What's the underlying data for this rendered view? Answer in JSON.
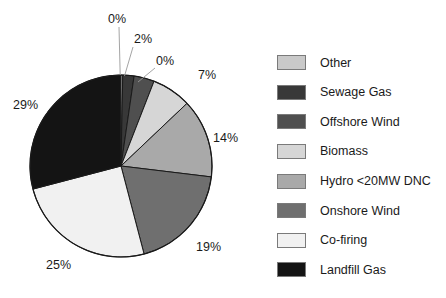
{
  "chart_data": {
    "type": "pie",
    "title": "",
    "subtitle": "",
    "xlabel": "",
    "ylabel": "",
    "legend_position": "right",
    "grid": false,
    "categories": [
      "Other",
      "Sewage Gas",
      "Offshore Wind",
      "Biomass",
      "Hydro <20MW DNC",
      "Onshore Wind",
      "Co-firing",
      "Landfill Gas"
    ],
    "values": [
      0,
      2,
      0,
      7,
      14,
      19,
      25,
      29
    ],
    "data_labels": [
      "0%",
      "2%",
      "0%",
      "7%",
      "14%",
      "19%",
      "25%",
      "29%"
    ],
    "slice_colors": [
      "#c9c9c9",
      "#383838",
      "#4f4f4f",
      "#d6d6d6",
      "#a9a9a9",
      "#6f6f6f",
      "#f1f1f1",
      "#141414"
    ],
    "slice_render_sweeps_deg": [
      1.1,
      7.2,
      13.0,
      25.2,
      50.4,
      68.4,
      90.0,
      104.4
    ],
    "start_angle_deg": 0,
    "direction": "clockwise",
    "stroke_color": "#1a1a1a"
  },
  "pie": {
    "center_x": 121,
    "center_y": 166,
    "radius": 91,
    "labels": [
      {
        "text": "0%",
        "x": 108,
        "y": 12,
        "leader": {
          "x1": 119,
          "y1": 27,
          "x2": 120.2,
          "y2": 75
        }
      },
      {
        "text": "2%",
        "x": 134,
        "y": 32,
        "leader": {
          "x1": 133,
          "y1": 47,
          "x2": 124.5,
          "y2": 76
        }
      },
      {
        "text": "0%",
        "x": 156,
        "y": 54,
        "leader": {
          "x1": 155,
          "y1": 68,
          "x2": 138,
          "y2": 82
        }
      },
      {
        "text": "7%",
        "x": 198,
        "y": 68,
        "leader": null
      },
      {
        "text": "14%",
        "x": 213,
        "y": 131,
        "leader": null
      },
      {
        "text": "19%",
        "x": 196,
        "y": 240,
        "leader": null
      },
      {
        "text": "25%",
        "x": 46,
        "y": 258,
        "leader": null
      },
      {
        "text": "29%",
        "x": 13,
        "y": 98,
        "leader": null
      }
    ]
  },
  "legend": {
    "items": [
      {
        "label": "Other",
        "color": "#c9c9c9"
      },
      {
        "label": "Sewage Gas",
        "color": "#383838"
      },
      {
        "label": "Offshore Wind",
        "color": "#4f4f4f"
      },
      {
        "label": "Biomass",
        "color": "#d6d6d6"
      },
      {
        "label": "Hydro <20MW DNC",
        "color": "#a9a9a9"
      },
      {
        "label": "Onshore Wind",
        "color": "#6f6f6f"
      },
      {
        "label": "Co-firing",
        "color": "#f1f1f1"
      },
      {
        "label": "Landfill Gas",
        "color": "#141414"
      }
    ]
  }
}
